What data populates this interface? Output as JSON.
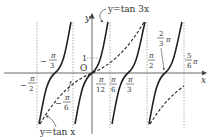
{
  "diagram": {
    "type": "function-graph",
    "curves": [
      {
        "name": "tan3x",
        "label": "y=tan 3x",
        "style": "solid",
        "color": "#222222"
      },
      {
        "name": "tanx",
        "label": "y=tan x",
        "style": "dashed",
        "color": "#222222"
      }
    ],
    "axes": {
      "x_label": "x",
      "y_label": "y",
      "origin_label": "O",
      "y_tick_label": "1"
    },
    "x_labels": [
      {
        "id": "neg_pi_2",
        "text": "−π/2"
      },
      {
        "id": "neg_pi_3",
        "text": "−π/3"
      },
      {
        "id": "neg_pi_6",
        "text": "−π/6"
      },
      {
        "id": "pi_12",
        "text": "π/12"
      },
      {
        "id": "pi_6",
        "text": "π/6"
      },
      {
        "id": "pi_3",
        "text": "π/3"
      },
      {
        "id": "pi_2",
        "text": "π/2"
      },
      {
        "id": "two_thirds_pi",
        "text": "2/3π"
      },
      {
        "id": "five_sixths_pi",
        "text": "5/6π"
      }
    ],
    "text": {
      "minus": "−",
      "pi": "π",
      "n1": "1",
      "n2": "2",
      "n3": "3",
      "n5": "5",
      "n6": "6",
      "n12": "12",
      "tan3x_label": "y=tan 3x",
      "tanx_label": "y=tan x"
    },
    "colors": {
      "curve": "#222222",
      "axis": "#555555",
      "guide": "#999999",
      "text": "#333333"
    }
  }
}
